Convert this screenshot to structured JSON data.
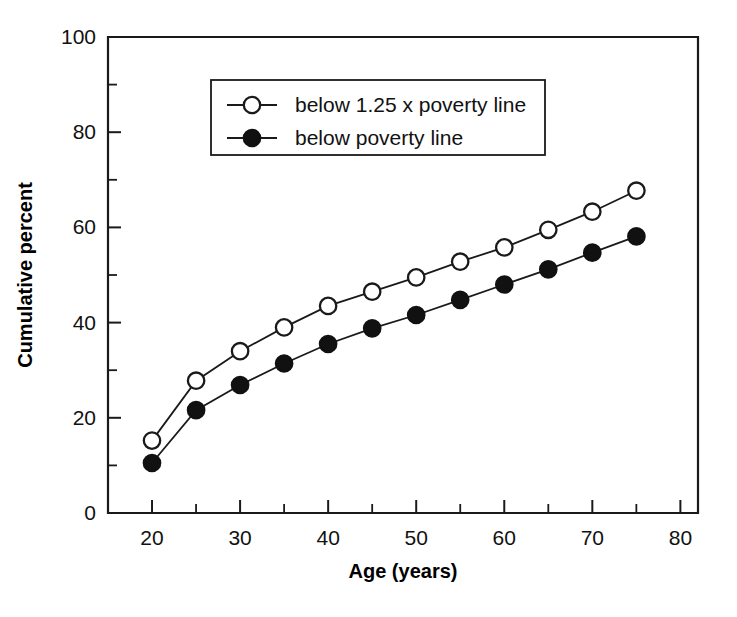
{
  "chart_data": {
    "type": "line",
    "title": "",
    "subtitle": "",
    "xlabel": "Age (years)",
    "ylabel": "Cumulative percent",
    "xlim": [
      15,
      82
    ],
    "ylim": [
      0,
      100
    ],
    "grid": false,
    "legend_position": "upper-left-inside",
    "x_major_ticks": [
      20,
      30,
      40,
      50,
      60,
      70,
      80
    ],
    "x_minor_ticks": [
      25,
      35,
      45,
      55,
      65,
      75
    ],
    "x_tick_labels": [
      "20",
      "30",
      "40",
      "50",
      "60",
      "70",
      "80"
    ],
    "y_major_ticks": [
      0,
      20,
      40,
      60,
      80,
      100
    ],
    "y_minor_ticks": [
      10,
      30,
      50,
      70,
      90
    ],
    "y_tick_labels": [
      "0",
      "20",
      "40",
      "60",
      "80",
      "100"
    ],
    "x": [
      20,
      25,
      30,
      35,
      40,
      45,
      50,
      55,
      60,
      65,
      70,
      75
    ],
    "series": [
      {
        "name": "below 1.25 x poverty line",
        "marker": "open-circle",
        "values": [
          15.2,
          27.8,
          34.0,
          39.0,
          43.5,
          46.5,
          49.5,
          52.8,
          55.8,
          59.5,
          63.3,
          67.7
        ]
      },
      {
        "name": "below poverty line",
        "marker": "filled-circle",
        "values": [
          10.5,
          21.6,
          26.9,
          31.4,
          35.5,
          38.8,
          41.6,
          44.8,
          48.0,
          51.2,
          54.7,
          58.1
        ]
      }
    ]
  },
  "legend": {
    "entries": [
      {
        "label": "below 1.25 x poverty line",
        "marker": "open-circle"
      },
      {
        "label": "below poverty line",
        "marker": "filled-circle"
      }
    ]
  },
  "axes": {
    "x_title": "Age (years)",
    "y_title": "Cumulative percent"
  },
  "colors": {
    "ink": "#1a1a1a",
    "background": "#ffffff",
    "marker_fill_open": "#ffffff",
    "marker_fill_closed": "#111111"
  }
}
